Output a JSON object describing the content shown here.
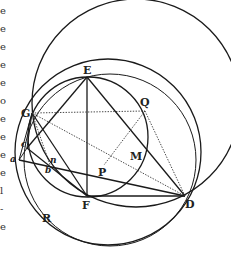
{
  "figure": {
    "type": "geometric construction",
    "points": {
      "E": {
        "label": "E",
        "x": 87,
        "y": 77
      },
      "G": {
        "label": "G",
        "x": 32,
        "y": 113
      },
      "Q": {
        "label": "Q",
        "x": 145,
        "y": 111
      },
      "P": {
        "label": "P",
        "x": 104,
        "y": 165
      },
      "M": {
        "label": "M",
        "x": 135,
        "y": 155
      },
      "D": {
        "label": "D",
        "x": 185,
        "y": 196
      },
      "F": {
        "label": "F",
        "x": 87,
        "y": 196
      },
      "R": {
        "label": "R",
        "x": 45,
        "y": 218
      },
      "a": {
        "label": "a",
        "x": 19,
        "y": 160
      },
      "c": {
        "label": "c",
        "x": 27,
        "y": 148
      },
      "b": {
        "label": "b",
        "x": 49,
        "y": 168
      },
      "n": {
        "label": "n",
        "x": 51,
        "y": 163
      }
    },
    "left_margin_fragments": [
      "e",
      "e",
      "e",
      "e",
      "e",
      "o",
      "e",
      "e",
      "e",
      "e",
      "l",
      "-",
      "e"
    ]
  }
}
